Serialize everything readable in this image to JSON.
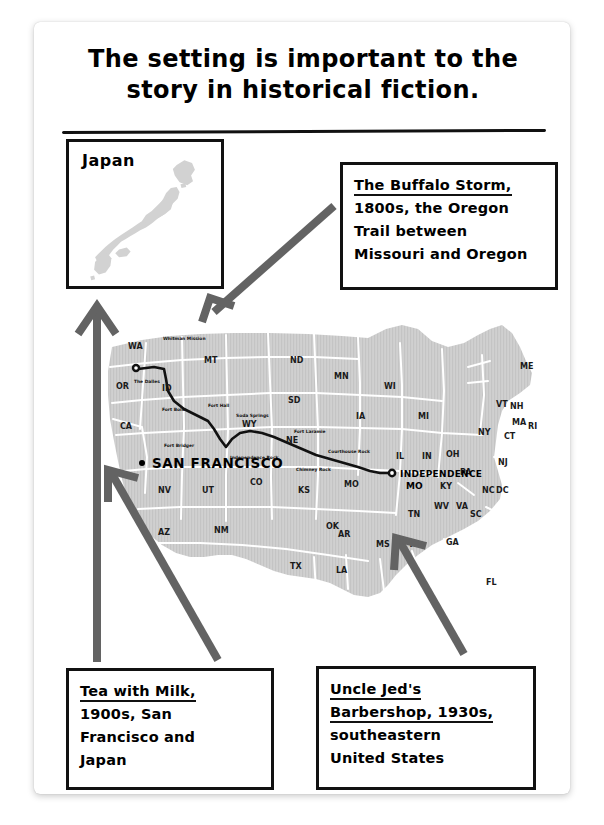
{
  "title": {
    "line1": "The setting is important to the",
    "line2": "story in historical fiction."
  },
  "inset": {
    "label": "Japan",
    "icon": "japan-map-shape"
  },
  "callouts": [
    {
      "id": "buffalo-storm",
      "lines": [
        {
          "text": "The Buffalo Storm,",
          "underline": true
        },
        {
          "text": "1800s, the Oregon",
          "underline": false
        },
        {
          "text": "Trail between",
          "underline": false
        },
        {
          "text": "Missouri and Oregon",
          "underline": false
        }
      ]
    },
    {
      "id": "tea-with-milk",
      "lines": [
        {
          "text": "Tea with Milk,",
          "underline": true
        },
        {
          "text": "1900s, San",
          "underline": false
        },
        {
          "text": "Francisco and",
          "underline": false
        },
        {
          "text": "Japan",
          "underline": false
        }
      ]
    },
    {
      "id": "uncle-jeds-barbershop",
      "lines": [
        {
          "text": "Uncle Jed's",
          "underline": true
        },
        {
          "text": "Barbershop, 1930s,",
          "underline": true
        },
        {
          "text": "southeastern",
          "underline": false
        },
        {
          "text": "United States",
          "underline": false
        }
      ]
    }
  ],
  "map": {
    "cities": [
      {
        "name": "SAN FRANCISCO",
        "marker": "dot"
      },
      {
        "name": "INDEPENDENCE",
        "marker": "circle-dot"
      },
      {
        "name": "MO",
        "marker": "none"
      }
    ],
    "state_labels": [
      "WA",
      "OR",
      "CA",
      "NV",
      "ID",
      "MT",
      "WY",
      "UT",
      "AZ",
      "CO",
      "NM",
      "ND",
      "SD",
      "NE",
      "KS",
      "OK",
      "TX",
      "MN",
      "IA",
      "MO",
      "AR",
      "LA",
      "WI",
      "IL",
      "IN",
      "MI",
      "OH",
      "KY",
      "TN",
      "MS",
      "AL",
      "GA",
      "FL",
      "SC",
      "NC",
      "VA",
      "WV",
      "PA",
      "NY",
      "ME",
      "VT",
      "NH",
      "MA",
      "RI",
      "CT",
      "NJ",
      "DC",
      "MD"
    ],
    "trail_landmarks": [
      "Whitman Mission",
      "The Dalles",
      "Fort Boise",
      "Fort Hall",
      "Soda Springs",
      "Fort Bridger",
      "Independence Rock",
      "Fort Laramie",
      "Courthouse Rock",
      "Chimney Rock"
    ],
    "trail_name": "Oregon Trail"
  },
  "arrows": [
    {
      "from": "buffalo-storm-callout",
      "to": "oregon-trail-start",
      "direction": "down-left"
    },
    {
      "from": "tea-callout",
      "to": "japan-inset",
      "direction": "up"
    },
    {
      "from": "tea-callout",
      "to": "san-francisco",
      "direction": "up-left"
    },
    {
      "from": "uncle-jed-callout",
      "to": "southeastern-states",
      "direction": "up-left"
    }
  ],
  "colors": {
    "ink": "#111111",
    "arrow": "#636363",
    "land": "#cfcfcf",
    "water": "#ffffff",
    "page": "#ffffff",
    "backdrop": "#ffffff"
  }
}
